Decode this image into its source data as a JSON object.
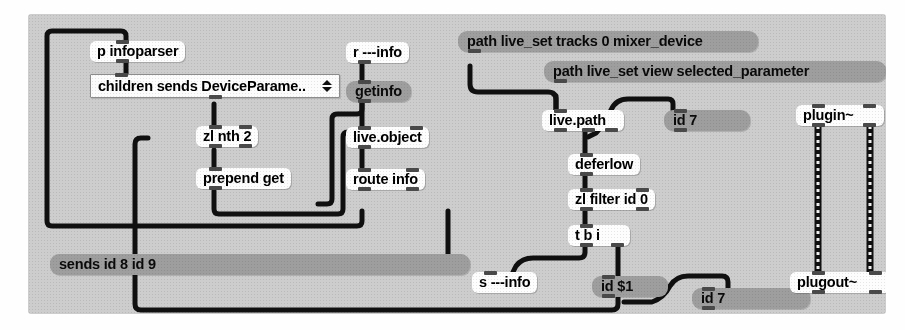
{
  "app": {
    "kind": "max-msp-patcher",
    "canvas_color": "#cdcdcd",
    "object_box_color": "#fdfdfd",
    "message_box_color": "#9e9e9e",
    "cable_color": "#101010"
  },
  "objects": {
    "p_infoparser": {
      "text": "p infoparser"
    },
    "umenu": {
      "value": "children sends DeviceParame..",
      "arrow_up": "▲",
      "arrow_down": "▼"
    },
    "zl_nth_2": {
      "text": "zl nth 2"
    },
    "prepend_get": {
      "text": "prepend get"
    },
    "r_info": {
      "text": "r ---info"
    },
    "getinfo": {
      "text": "getinfo"
    },
    "live_object": {
      "text": "live.object"
    },
    "route_info": {
      "text": "route info"
    },
    "sends_id_8_id_9": {
      "text": "sends id 8 id 9"
    },
    "path_mixer_device": {
      "text": "path live_set tracks 0 mixer_device"
    },
    "path_selected_param": {
      "text": "path live_set view selected_parameter"
    },
    "live_path": {
      "text": "live.path"
    },
    "id_7_top": {
      "text": "id 7"
    },
    "deferlow": {
      "text": "deferlow"
    },
    "zl_filter_id_0": {
      "text": "zl filter id 0"
    },
    "t_b_i": {
      "text": "t b i"
    },
    "s_info": {
      "text": "s ---info"
    },
    "id_dollar1": {
      "text": "id $1"
    },
    "id_7_bottom": {
      "text": "id 7"
    },
    "plugin": {
      "text": "plugin~"
    },
    "plugout": {
      "text": "plugout~"
    }
  }
}
